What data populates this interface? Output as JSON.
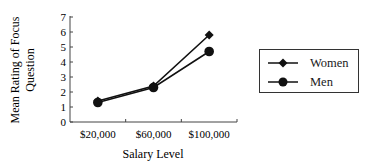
{
  "chart_data": {
    "type": "line",
    "title": "",
    "xlabel": "Salary Level",
    "ylabel": "Mean Rating of Focus Question",
    "ylabel_lines": [
      "Mean Rating of Focus",
      "Question"
    ],
    "categories": [
      "$20,000",
      "$60,000",
      "$100,000"
    ],
    "series": [
      {
        "name": "Women",
        "marker": "diamond",
        "values": [
          1.4,
          2.4,
          5.8
        ]
      },
      {
        "name": "Men",
        "marker": "circle",
        "values": [
          1.3,
          2.3,
          4.7
        ]
      }
    ],
    "ylim": [
      0,
      7
    ],
    "yticks": [
      0,
      1,
      2,
      3,
      4,
      5,
      6,
      7
    ],
    "grid": false,
    "legend_position": "right"
  },
  "legend": {
    "items": [
      {
        "label": "Women"
      },
      {
        "label": "Men"
      }
    ]
  }
}
